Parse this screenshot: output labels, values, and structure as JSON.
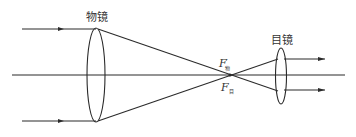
{
  "diagram": {
    "title": "",
    "type": "telescope ray diagram",
    "colors": {
      "stroke": "#2a2a2a",
      "text": "#333333",
      "background": "#ffffff"
    },
    "labels": {
      "objective": "物镜",
      "eyepiece": "目镜",
      "objective_focus": {
        "main": "F",
        "prime": "′",
        "sub": "物"
      },
      "eyepiece_focus": {
        "main": "F",
        "sub": "目"
      }
    },
    "elements": {
      "optical_axis": {
        "x1": 12,
        "x2": 345,
        "y": 75
      },
      "objective_lens": {
        "cx": 96,
        "cy": 75,
        "rx": 9,
        "ry": 47
      },
      "eyepiece_lens": {
        "cx": 281,
        "cy": 76,
        "rx": 5.5,
        "ry": 28
      },
      "focal_point": {
        "x": 230,
        "y": 75
      },
      "incoming_rays": [
        {
          "x1": 22,
          "y": 29,
          "arrow_x": 62
        },
        {
          "x1": 22,
          "y": 121,
          "arrow_x": 62
        }
      ],
      "outgoing_rays": [
        {
          "x2": 325,
          "y": 59
        },
        {
          "x2": 325,
          "y": 90
        }
      ]
    }
  }
}
